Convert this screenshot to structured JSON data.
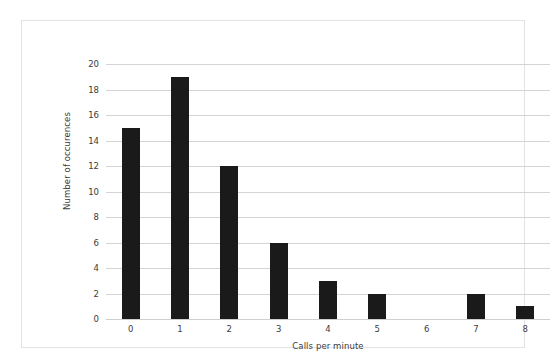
{
  "chart_data": {
    "type": "bar",
    "title": "",
    "subtitle": "",
    "xlabel": "Calls per minute",
    "ylabel": "Number of occurences",
    "categories": [
      "0",
      "1",
      "2",
      "3",
      "4",
      "5",
      "6",
      "7",
      "8"
    ],
    "values": [
      15,
      19,
      12,
      6,
      3,
      2,
      0,
      2,
      1
    ],
    "series": [
      {
        "name": "Number of occurences",
        "values": [
          15,
          19,
          12,
          6,
          3,
          2,
          0,
          2,
          1
        ]
      }
    ],
    "ylim": [
      0,
      20
    ],
    "ytick_labels": [
      "0",
      "2",
      "4",
      "6",
      "8",
      "10",
      "12",
      "14",
      "16",
      "18",
      "20"
    ],
    "ytick_values": [
      0,
      2,
      4,
      6,
      8,
      10,
      12,
      14,
      16,
      18,
      20
    ],
    "xtick_labels": [
      "0",
      "1",
      "2",
      "3",
      "4",
      "5",
      "6",
      "7",
      "8"
    ],
    "grid": true,
    "grid_axis": "y",
    "legend": false,
    "legend_position": "none",
    "annotations": [],
    "colors": {
      "bar": "#1a1a1a",
      "gridline": "#d4d4d4",
      "frame_border": "#e3e3e3",
      "text": "#3b3b3b",
      "background": "#ffffff"
    }
  }
}
